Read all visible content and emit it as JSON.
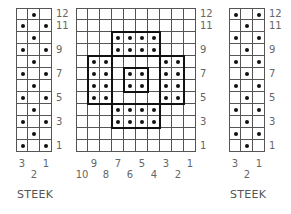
{
  "charts": [
    {
      "id": "steek-left",
      "left": 16,
      "top": 8,
      "cols": 3,
      "rows": 12,
      "cell": 12,
      "title": "STEEK",
      "pattern": [
        ".X.",
        "X.X",
        ".X.",
        "X.X",
        ".X.",
        "X.X",
        ".X.",
        "X.X",
        ".X.",
        "X.X",
        ".X.",
        "X.X"
      ],
      "row_labels": [
        "12",
        "11",
        "9",
        "7",
        "5",
        "3",
        "1"
      ],
      "row_label_rows": [
        12,
        11,
        9,
        7,
        5,
        3,
        1
      ],
      "col_labels_top": [
        {
          "text": "3",
          "col": 3
        },
        {
          "text": "1",
          "col": 1
        }
      ],
      "col_labels_bottom": [
        {
          "text": "2",
          "col": 2
        }
      ],
      "boxes": []
    },
    {
      "id": "motif-center",
      "left": 76,
      "top": 8,
      "cols": 10,
      "rows": 12,
      "cell": 12,
      "title": "",
      "pattern": [
        "..........",
        "..........",
        "...XXXX...",
        "...XXXX...",
        ".XX....XX.",
        ".XX.XX.XX.",
        ".XX.XX.XX.",
        ".XX....XX.",
        "...XXXX...",
        "...XXXX...",
        "..........",
        ".........."
      ],
      "row_labels": [
        "12",
        "11",
        "9",
        "7",
        "5",
        "3",
        "1"
      ],
      "row_label_rows": [
        12,
        11,
        9,
        7,
        5,
        3,
        1
      ],
      "col_labels_top": [
        {
          "text": "9",
          "col": 9
        },
        {
          "text": "7",
          "col": 7
        },
        {
          "text": "5",
          "col": 5
        },
        {
          "text": "3",
          "col": 3
        },
        {
          "text": "1",
          "col": 1
        }
      ],
      "col_labels_bottom": [
        {
          "text": "10",
          "col": 10
        },
        {
          "text": "8",
          "col": 8
        },
        {
          "text": "6",
          "col": 6
        },
        {
          "text": "4",
          "col": 4
        },
        {
          "text": "2",
          "col": 2
        }
      ],
      "boxes": [
        {
          "c": 3,
          "r": 2,
          "w": 4,
          "h": 2
        },
        {
          "c": 1,
          "r": 4,
          "w": 2,
          "h": 4
        },
        {
          "c": 7,
          "r": 4,
          "w": 2,
          "h": 4
        },
        {
          "c": 4,
          "r": 5,
          "w": 2,
          "h": 2
        },
        {
          "c": 3,
          "r": 8,
          "w": 4,
          "h": 2
        }
      ]
    },
    {
      "id": "steek-right",
      "left": 229,
      "top": 8,
      "cols": 3,
      "rows": 12,
      "cell": 12,
      "title": "STEEK",
      "pattern": [
        "X.X",
        ".X.",
        "X.X",
        ".X.",
        "X.X",
        ".X.",
        "X.X",
        ".X.",
        "X.X",
        ".X.",
        "X.X",
        ".X."
      ],
      "row_labels": [
        "12",
        "11",
        "9",
        "7",
        "5",
        "3",
        "1"
      ],
      "row_label_rows": [
        12,
        11,
        9,
        7,
        5,
        3,
        1
      ],
      "col_labels_top": [
        {
          "text": "3",
          "col": 3
        },
        {
          "text": "1",
          "col": 1
        }
      ],
      "col_labels_bottom": [
        {
          "text": "2",
          "col": 2
        }
      ],
      "boxes": []
    }
  ],
  "legend": {
    "dot_symbol": "contrast-color stitch",
    "empty_symbol": "main-color stitch"
  }
}
